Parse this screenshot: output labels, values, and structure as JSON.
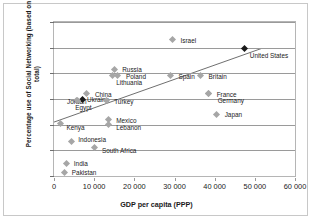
{
  "chart_data": {
    "type": "scatter",
    "title": "",
    "xlabel": "GDP per capita (PPP)",
    "ylabel": "Percentage use of Social Networking (based on total)",
    "xlim": [
      0,
      60000
    ],
    "ylim": [
      0,
      60
    ],
    "xticks": [
      "0",
      "10 000",
      "20 000",
      "30 000",
      "40 000",
      "50 000",
      "60 000"
    ],
    "xtick_values": [
      0,
      10000,
      20000,
      30000,
      40000,
      50000,
      60000
    ],
    "yticks": [
      "0",
      "10",
      "20",
      "30",
      "40",
      "50",
      "60"
    ],
    "ytick_values": [
      0,
      10,
      20,
      30,
      40,
      50,
      60
    ],
    "grid": "horizontal",
    "legend": "none",
    "marker": "diamond",
    "marker_color": "#a6a6a6",
    "highlight_color": "#1a1a1a",
    "points": [
      {
        "label": "Russia",
        "x": 15000,
        "y": 41.5,
        "label_dx": 5,
        "label_dy": 0,
        "dark": false
      },
      {
        "label": "Poland",
        "x": 15700,
        "y": 39.0,
        "label_dx": 6,
        "label_dy": 0,
        "dark": false
      },
      {
        "label": "Lithuania",
        "x": 14500,
        "y": 39.0,
        "label_dx": 1,
        "label_dy": 6,
        "dark": false
      },
      {
        "label": "Israel",
        "x": 29500,
        "y": 53.0,
        "label_dx": 5,
        "label_dy": 0,
        "dark": false
      },
      {
        "label": "Spain",
        "x": 29000,
        "y": 39.0,
        "label_dx": 5,
        "label_dy": 0,
        "dark": false
      },
      {
        "label": "Britain",
        "x": 36500,
        "y": 39.0,
        "label_dx": 5,
        "label_dy": 0,
        "dark": false
      },
      {
        "label": "United States",
        "x": 47500,
        "y": 49.5,
        "label_dx": 2,
        "label_dy": 6,
        "dark": true
      },
      {
        "label": "France",
        "x": 38500,
        "y": 32.0,
        "label_dx": 5,
        "label_dy": 0,
        "dark": false
      },
      {
        "label": "Germany",
        "x": 38500,
        "y": 32.0,
        "label_dx": 6,
        "label_dy": 6,
        "dark": false
      },
      {
        "label": "Japan",
        "x": 40500,
        "y": 24.0,
        "label_dx": 5,
        "label_dy": 0,
        "dark": false
      },
      {
        "label": "China",
        "x": 8200,
        "y": 32.0,
        "label_dx": 5,
        "label_dy": 0,
        "dark": false
      },
      {
        "label": "Ukraine",
        "x": 7000,
        "y": 30.0,
        "label_dx": 2,
        "label_dy": 0,
        "dark": true
      },
      {
        "label": "Jordan",
        "x": 5500,
        "y": 29.5,
        "label_dx": -12,
        "label_dy": 1,
        "dark": false
      },
      {
        "label": "Egypt",
        "x": 5800,
        "y": 29.5,
        "label_dx": -5,
        "label_dy": 7,
        "dark": false
      },
      {
        "label": "Turkey",
        "x": 13000,
        "y": 29.5,
        "label_dx": 5,
        "label_dy": 1,
        "dark": false
      },
      {
        "label": "Mexico",
        "x": 13500,
        "y": 22.0,
        "label_dx": 5,
        "label_dy": 0,
        "dark": false
      },
      {
        "label": "Lebanon",
        "x": 13500,
        "y": 20.0,
        "label_dx": 5,
        "label_dy": 2,
        "dark": false
      },
      {
        "label": "Kenya",
        "x": 1600,
        "y": 20.5,
        "label_dx": 3,
        "label_dy": 4,
        "dark": false
      },
      {
        "label": "Indonesia",
        "x": 4300,
        "y": 13.5,
        "label_dx": 4,
        "label_dy": -2,
        "dark": false
      },
      {
        "label": "South Africa",
        "x": 10200,
        "y": 11.0,
        "label_dx": 4,
        "label_dy": 2,
        "dark": false
      },
      {
        "label": "India",
        "x": 3200,
        "y": 5.0,
        "label_dx": 4,
        "label_dy": 0,
        "dark": false
      },
      {
        "label": "Pakistan",
        "x": 2700,
        "y": 1.5,
        "label_dx": 4,
        "label_dy": 0,
        "dark": false
      }
    ],
    "trendline": {
      "x0": 0,
      "y0": 20.5,
      "x1": 52000,
      "y1": 49.5,
      "color": "#4a4a4a"
    }
  }
}
